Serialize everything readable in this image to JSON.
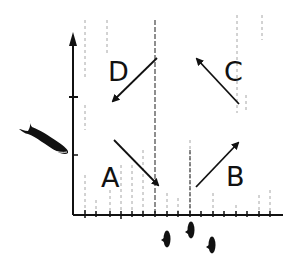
{
  "figure": {
    "type": "schematic-quadrant-diagram",
    "colors": {
      "ink": "#111111",
      "background": "#ffffff",
      "gridline": "#8a8a8a"
    },
    "quadrants": [
      {
        "label": "D",
        "position": "top-left",
        "arrow_direction": "down-left"
      },
      {
        "label": "C",
        "position": "top-right",
        "arrow_direction": "up-left"
      },
      {
        "label": "A",
        "position": "bottom-left",
        "arrow_direction": "down-right"
      },
      {
        "label": "B",
        "position": "bottom-right",
        "arrow_direction": "up-right"
      }
    ],
    "icons": {
      "y_axis_marker": "large-fish-icon",
      "x_axis_marker": "small-fish-group-icon"
    }
  }
}
